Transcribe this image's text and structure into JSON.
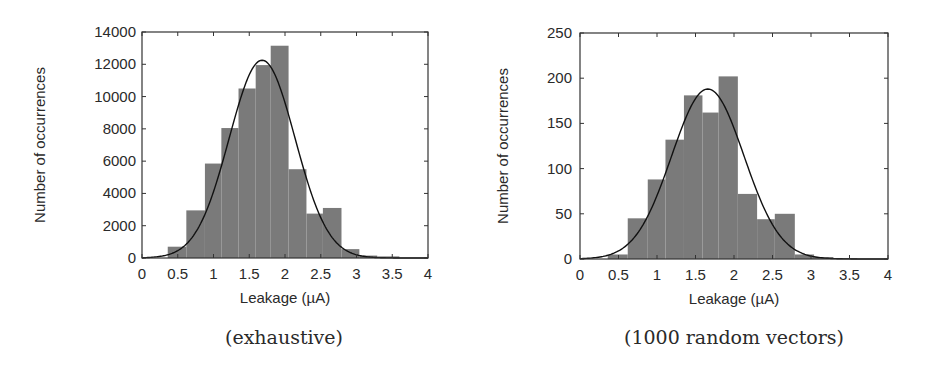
{
  "chart_data": [
    {
      "type": "bar",
      "subtype": "histogram_with_normal_fit",
      "caption": "(exhaustive)",
      "title": "",
      "xlabel": "Leakage (µA)",
      "ylabel": "Number of occurrences",
      "xlim": [
        0,
        4
      ],
      "ylim": [
        0,
        14000
      ],
      "xticks": [
        "0",
        "0.5",
        "1",
        "1.5",
        "2",
        "2.5",
        "3",
        "3.5",
        "4"
      ],
      "yticks": [
        "0",
        "2000",
        "4000",
        "6000",
        "8000",
        "10000",
        "12000",
        "14000"
      ],
      "grid": false,
      "legend": null,
      "bar_color": "#7a7a7a",
      "fit_color": "#111111",
      "bins": [
        {
          "x0": 0.36,
          "x1": 0.62,
          "count": 700
        },
        {
          "x0": 0.62,
          "x1": 0.88,
          "count": 2950
        },
        {
          "x0": 0.88,
          "x1": 1.11,
          "count": 5850
        },
        {
          "x0": 1.11,
          "x1": 1.35,
          "count": 8050
        },
        {
          "x0": 1.35,
          "x1": 1.59,
          "count": 10500
        },
        {
          "x0": 1.59,
          "x1": 1.8,
          "count": 11950
        },
        {
          "x0": 1.8,
          "x1": 2.05,
          "count": 13150
        },
        {
          "x0": 2.05,
          "x1": 2.3,
          "count": 5500
        },
        {
          "x0": 2.3,
          "x1": 2.53,
          "count": 2750
        },
        {
          "x0": 2.53,
          "x1": 2.79,
          "count": 3100
        },
        {
          "x0": 2.79,
          "x1": 3.04,
          "count": 550
        },
        {
          "x0": 3.04,
          "x1": 3.29,
          "count": 150
        },
        {
          "x0": 3.29,
          "x1": 3.6,
          "count": 100
        }
      ],
      "fit": {
        "distribution": "normal",
        "mean": 1.68,
        "sigma": 0.46,
        "peak": 12250
      }
    },
    {
      "type": "bar",
      "subtype": "histogram_with_normal_fit",
      "caption": "(1000 random vectors)",
      "title": "",
      "xlabel": "Leakage (µA)",
      "ylabel": "Number of occurrences",
      "xlim": [
        0,
        4
      ],
      "ylim": [
        0,
        250
      ],
      "xticks": [
        "0",
        "0.5",
        "1",
        "1.5",
        "2",
        "2.5",
        "3",
        "3.5",
        "4"
      ],
      "yticks": [
        "0",
        "50",
        "100",
        "150",
        "200",
        "250"
      ],
      "grid": false,
      "legend": null,
      "bar_color": "#7a7a7a",
      "fit_color": "#111111",
      "bins": [
        {
          "x0": 0.36,
          "x1": 0.62,
          "count": 5
        },
        {
          "x0": 0.62,
          "x1": 0.88,
          "count": 45
        },
        {
          "x0": 0.88,
          "x1": 1.11,
          "count": 88
        },
        {
          "x0": 1.11,
          "x1": 1.35,
          "count": 132
        },
        {
          "x0": 1.35,
          "x1": 1.59,
          "count": 181
        },
        {
          "x0": 1.59,
          "x1": 1.8,
          "count": 162
        },
        {
          "x0": 1.8,
          "x1": 2.05,
          "count": 202
        },
        {
          "x0": 2.05,
          "x1": 2.3,
          "count": 72
        },
        {
          "x0": 2.3,
          "x1": 2.53,
          "count": 44
        },
        {
          "x0": 2.53,
          "x1": 2.79,
          "count": 50
        },
        {
          "x0": 2.79,
          "x1": 3.04,
          "count": 5
        },
        {
          "x0": 3.04,
          "x1": 3.29,
          "count": 2
        },
        {
          "x0": 3.29,
          "x1": 3.6,
          "count": 1
        }
      ],
      "fit": {
        "distribution": "normal",
        "mean": 1.66,
        "sigma": 0.47,
        "peak": 188
      }
    }
  ],
  "panels": [
    {
      "caption": "(exhaustive)",
      "xlabel": "Leakage (µA)",
      "ylabel": "Number of occurrences"
    },
    {
      "caption": "(1000 random vectors)",
      "xlabel": "Leakage (µA)",
      "ylabel": "Number of occurrences"
    }
  ]
}
